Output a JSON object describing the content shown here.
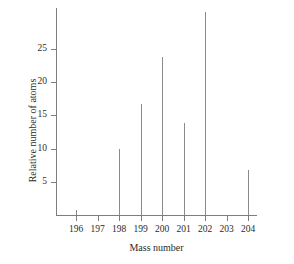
{
  "chart_data": {
    "type": "bar",
    "title": "",
    "subtitle": "",
    "xlabel": "Mass number",
    "ylabel": "Relative number of atoms",
    "categories": [
      "196",
      "197",
      "198",
      "199",
      "200",
      "201",
      "202",
      "203",
      "204"
    ],
    "values": [
      0.7,
      0,
      10,
      16.7,
      23.7,
      13.8,
      30.5,
      0,
      6.8
    ],
    "series": [
      {
        "name": "Relative number of atoms",
        "values": [
          0.7,
          0,
          10,
          16.7,
          23.7,
          13.8,
          30.5,
          0,
          6.8
        ]
      }
    ],
    "xlim": [
      195.5,
      204.8
    ],
    "ylim": [
      0,
      31.3
    ],
    "y_ticks": [
      5,
      10,
      15,
      20,
      25
    ],
    "y_tick_labels": [
      "5",
      "10",
      "15",
      "20",
      "25"
    ],
    "x_ticks": [
      196,
      197,
      198,
      199,
      200,
      201,
      202,
      203,
      204
    ],
    "grid": false,
    "legend": false,
    "legend_position": "none",
    "line_color": "#8a8a8a",
    "axis_color": "#7d7d7d",
    "text_color": "#2b2b2b",
    "background_color": "#ffffff"
  }
}
